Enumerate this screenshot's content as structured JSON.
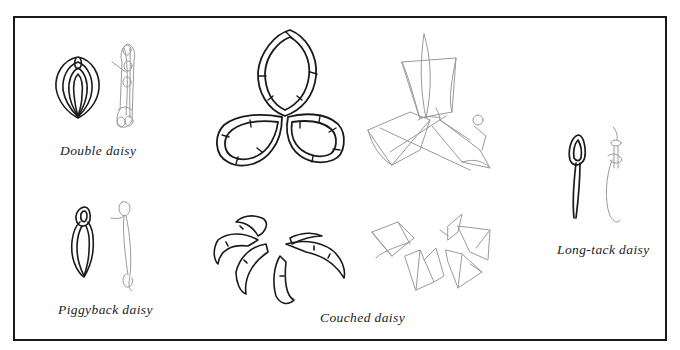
{
  "figure": {
    "colors": {
      "border": "#1a1a1a",
      "finished_stitch": "#1a1a1a",
      "working_diagram": "#9a9a9a",
      "background": "#ffffff"
    },
    "panels": [
      {
        "id": "double",
        "caption": "Double daisy",
        "finished_icon": "double-daisy-stitch",
        "diagram_icon": "double-daisy-working-diagram"
      },
      {
        "id": "piggyback",
        "caption": "Piggyback daisy",
        "finished_icon": "piggyback-daisy-stitch",
        "diagram_icon": "piggyback-daisy-working-diagram"
      },
      {
        "id": "couched",
        "caption": "Couched daisy",
        "finished_icon": "couched-daisy-stitch",
        "diagram_icon": "couched-daisy-working-diagram"
      },
      {
        "id": "longtack",
        "caption": "Long-tack daisy",
        "finished_icon": "long-tack-daisy-stitch",
        "diagram_icon": "long-tack-daisy-working-diagram"
      }
    ]
  }
}
